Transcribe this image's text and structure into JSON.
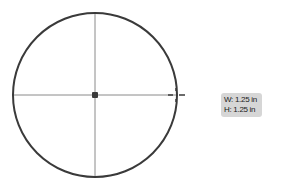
{
  "shape": {
    "type": "circle",
    "stroke_color": "#3a3a3a",
    "guide_color": "#8a8a8a"
  },
  "tooltip": {
    "width_label": "W: 1.25 in",
    "height_label": "H: 1.25 in"
  }
}
